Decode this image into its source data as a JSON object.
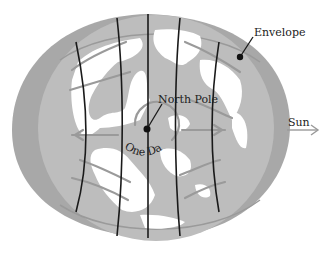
{
  "diagram": {
    "type": "polar-projection-globe",
    "labels": {
      "envelope": "Envelope",
      "north_pole": "North Pole",
      "one_day": "One Day",
      "sun": "Sun"
    },
    "colors": {
      "background": "#ffffff",
      "envelope": "#a8a8a8",
      "ocean": "#bdbdbd",
      "land": "#ffffff",
      "meridians": "#1a1a1a",
      "flow_arrows": "#9a9a9a",
      "text": "#222222"
    },
    "elements": {
      "meridian_count": 5,
      "flow_arrows_left": 4,
      "flow_arrows_right": 4,
      "pole_marker": "filled-circle"
    }
  }
}
